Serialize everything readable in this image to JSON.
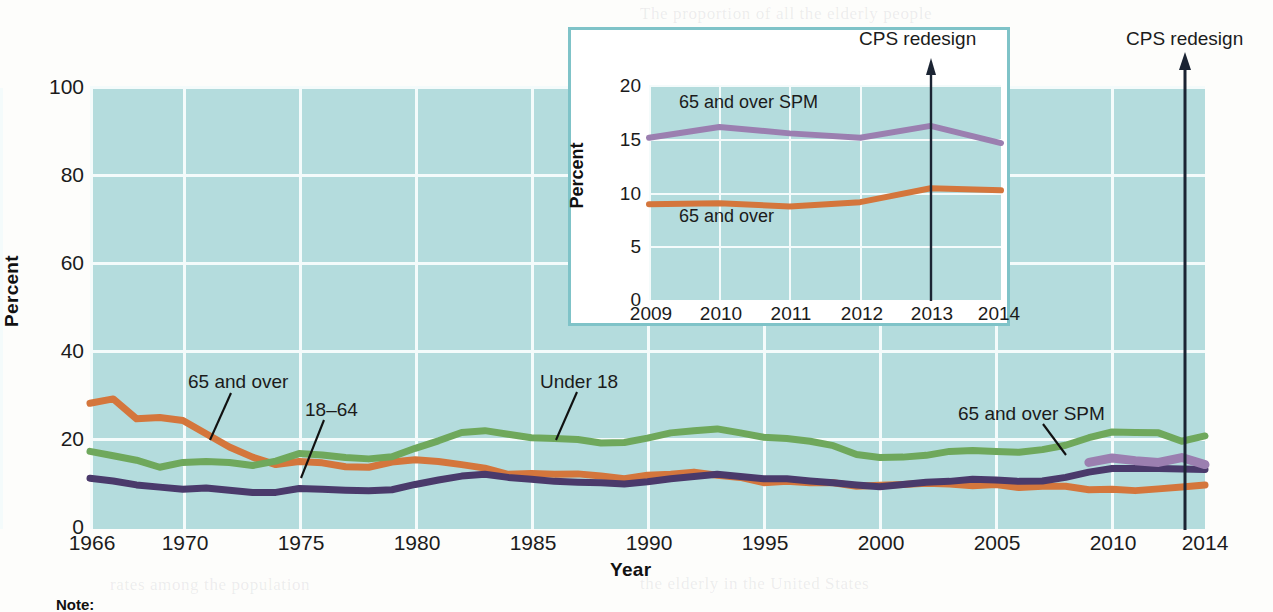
{
  "chart_data": [
    {
      "id": "main",
      "type": "line",
      "title": "",
      "xlabel": "Year",
      "ylabel": "Percent",
      "xlim": [
        1966,
        2014
      ],
      "ylim": [
        0,
        100
      ],
      "yticks": [
        0,
        20,
        40,
        60,
        80,
        100
      ],
      "xticks": [
        1966,
        1970,
        1975,
        1980,
        1985,
        1990,
        1995,
        2000,
        2005,
        2010,
        2014
      ],
      "grid": true,
      "legend_position": "inline-annotations",
      "annotations": [
        {
          "text": "CPS redesign",
          "x": 2013,
          "kind": "arrow-up"
        }
      ],
      "series": [
        {
          "name": "65 and over",
          "color": "#d4763c",
          "label_text": "65 and over",
          "x": [
            1966,
            1967,
            1968,
            1969,
            1970,
            1971,
            1972,
            1973,
            1974,
            1975,
            1976,
            1977,
            1978,
            1979,
            1980,
            1981,
            1982,
            1983,
            1984,
            1985,
            1986,
            1987,
            1988,
            1989,
            1990,
            1991,
            1992,
            1993,
            1994,
            1995,
            1996,
            1997,
            1998,
            1999,
            2000,
            2001,
            2002,
            2003,
            2004,
            2005,
            2006,
            2007,
            2008,
            2009,
            2010,
            2011,
            2012,
            2013,
            2014
          ],
          "values": [
            28.5,
            29.5,
            25.0,
            25.3,
            24.6,
            21.6,
            18.6,
            16.3,
            14.6,
            15.3,
            15.0,
            14.1,
            14.0,
            15.2,
            15.7,
            15.3,
            14.6,
            13.8,
            12.4,
            12.6,
            12.4,
            12.5,
            12.0,
            11.4,
            12.2,
            12.4,
            12.9,
            12.2,
            11.7,
            10.5,
            10.8,
            10.5,
            10.5,
            9.7,
            9.9,
            10.1,
            10.4,
            10.2,
            9.8,
            10.1,
            9.4,
            9.7,
            9.7,
            8.9,
            9.0,
            8.7,
            9.1,
            9.5,
            10.0
          ]
        },
        {
          "name": "18–64",
          "color": "#4a3a6b",
          "label_text": "18–64",
          "x": [
            1966,
            1967,
            1968,
            1969,
            1970,
            1971,
            1972,
            1973,
            1974,
            1975,
            1976,
            1977,
            1978,
            1979,
            1980,
            1981,
            1982,
            1983,
            1984,
            1985,
            1986,
            1987,
            1988,
            1989,
            1990,
            1991,
            1992,
            1993,
            1994,
            1995,
            1996,
            1997,
            1998,
            1999,
            2000,
            2001,
            2002,
            2003,
            2004,
            2005,
            2006,
            2007,
            2008,
            2009,
            2010,
            2011,
            2012,
            2013,
            2014
          ],
          "values": [
            11.5,
            10.9,
            10.0,
            9.5,
            9.0,
            9.3,
            8.8,
            8.3,
            8.3,
            9.2,
            9.0,
            8.8,
            8.7,
            8.9,
            10.1,
            11.1,
            12.0,
            12.4,
            11.7,
            11.3,
            10.8,
            10.6,
            10.5,
            10.2,
            10.7,
            11.4,
            11.9,
            12.4,
            11.9,
            11.4,
            11.4,
            10.9,
            10.5,
            10.0,
            9.6,
            10.1,
            10.6,
            10.8,
            11.3,
            11.1,
            10.8,
            10.9,
            11.7,
            12.9,
            13.7,
            13.7,
            13.7,
            13.6,
            13.5
          ]
        },
        {
          "name": "Under 18",
          "color": "#6fa85c",
          "label_text": "Under 18",
          "x": [
            1966,
            1967,
            1968,
            1969,
            1970,
            1971,
            1972,
            1973,
            1974,
            1975,
            1976,
            1977,
            1978,
            1979,
            1980,
            1981,
            1982,
            1983,
            1984,
            1985,
            1986,
            1987,
            1988,
            1989,
            1990,
            1991,
            1992,
            1993,
            1994,
            1995,
            1996,
            1997,
            1998,
            1999,
            2000,
            2001,
            2002,
            2003,
            2004,
            2005,
            2006,
            2007,
            2008,
            2009,
            2010,
            2011,
            2012,
            2013,
            2014
          ],
          "values": [
            17.6,
            16.6,
            15.6,
            14.0,
            15.1,
            15.3,
            15.1,
            14.4,
            15.4,
            17.1,
            16.8,
            16.2,
            15.9,
            16.4,
            18.3,
            20.0,
            21.9,
            22.3,
            21.5,
            20.7,
            20.5,
            20.3,
            19.5,
            19.6,
            20.6,
            21.8,
            22.3,
            22.7,
            21.8,
            20.8,
            20.5,
            19.9,
            18.9,
            16.9,
            16.2,
            16.3,
            16.7,
            17.6,
            17.8,
            17.6,
            17.4,
            18.0,
            19.0,
            20.7,
            22.0,
            21.9,
            21.8,
            19.9,
            21.1
          ]
        },
        {
          "name": "65 and over SPM",
          "color": "#9b7fb0",
          "label_text": "65 and over SPM",
          "x": [
            2009,
            2010,
            2011,
            2012,
            2013,
            2014
          ],
          "values": [
            15.1,
            16.1,
            15.5,
            15.1,
            16.2,
            14.6
          ]
        }
      ]
    },
    {
      "id": "inset",
      "type": "line",
      "title": "",
      "xlabel": "",
      "ylabel": "Percent",
      "xlim": [
        2009,
        2014
      ],
      "ylim": [
        0,
        20
      ],
      "yticks": [
        0,
        5,
        10,
        15,
        20
      ],
      "xticks": [
        2009,
        2010,
        2011,
        2012,
        2013,
        2014
      ],
      "grid": true,
      "annotations": [
        {
          "text": "CPS redesign",
          "x": 2013,
          "kind": "arrow-up"
        }
      ],
      "series": [
        {
          "name": "65 and over SPM",
          "color": "#9b7fb0",
          "label_text": "65 and over SPM",
          "x": [
            2009,
            2010,
            2011,
            2012,
            2013,
            2014
          ],
          "values": [
            15.1,
            16.1,
            15.5,
            15.1,
            16.2,
            14.6
          ]
        },
        {
          "name": "65 and over",
          "color": "#d4763c",
          "label_text": "65 and over",
          "x": [
            2009,
            2010,
            2011,
            2012,
            2013,
            2014
          ],
          "values": [
            8.9,
            9.0,
            8.7,
            9.1,
            10.4,
            10.2
          ]
        }
      ]
    }
  ],
  "main": {
    "y_axis_title": "Percent",
    "x_axis_title": "Year",
    "yticks": [
      "100",
      "80",
      "60",
      "40",
      "20",
      "0"
    ],
    "xticks": [
      "1966",
      "1970",
      "1975",
      "1980",
      "1985",
      "1990",
      "1995",
      "2000",
      "2005",
      "2010",
      "2014"
    ],
    "labels": {
      "over65": "65 and over",
      "adults": "18–64",
      "under18": "Under 18",
      "spm": "65 and over SPM",
      "cps": "CPS redesign"
    }
  },
  "inset": {
    "y_axis_title": "Percent",
    "yticks": [
      "20",
      "15",
      "10",
      "5",
      "0"
    ],
    "xticks": [
      "2009",
      "2010",
      "2011",
      "2012",
      "2013",
      "2014"
    ],
    "labels": {
      "spm": "65 and over SPM",
      "over65": "65 and over",
      "cps": "CPS redesign"
    }
  },
  "footer": {
    "copyright": "© 2019 Cengage",
    "note": "Note:"
  },
  "colors": {
    "plot_background": "#b4dcdd",
    "gridline": "#f4fbfb",
    "over65": "#d4763c",
    "adults": "#4a3a6b",
    "under18": "#6fa85c",
    "spm": "#9b7fb0",
    "inset_border": "#7fc3c8",
    "axis_text": "#1b1b1b"
  }
}
